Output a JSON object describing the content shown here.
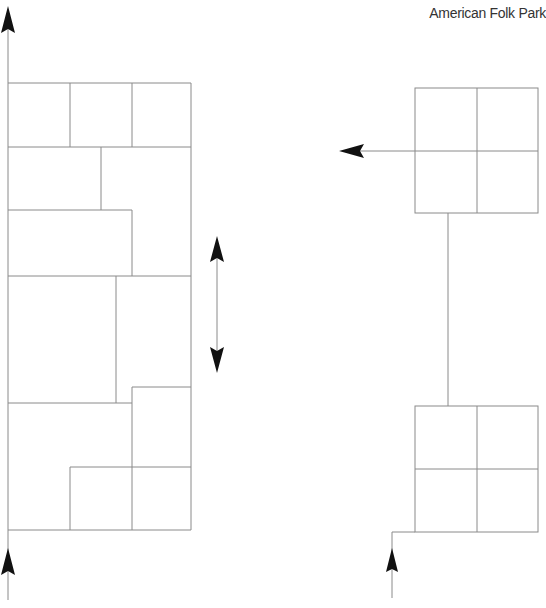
{
  "title": "American Folk Park",
  "colors": {
    "line": "#8a8a8a",
    "arrow": "#111111",
    "background": "#ffffff",
    "text": "#333333"
  },
  "diagram": {
    "left_block": {
      "description": "Stacked rectangular building layout with main path on left edge",
      "outline": {
        "x": 8,
        "y": 83,
        "w": 183,
        "h": 447
      }
    },
    "right_blocks": [
      {
        "name": "upper-2x2-block",
        "x": 415,
        "y": 88,
        "w": 123,
        "h": 125
      },
      {
        "name": "lower-2x2-block",
        "x": 415,
        "y": 406,
        "w": 123,
        "h": 126
      }
    ],
    "arrows": [
      {
        "name": "left-path-arrow-up-top",
        "direction": "up"
      },
      {
        "name": "left-path-arrow-up-bottom",
        "direction": "up"
      },
      {
        "name": "middle-double-arrow",
        "direction": "up-down"
      },
      {
        "name": "right-exit-arrow-left",
        "direction": "left"
      },
      {
        "name": "right-entry-arrow-up",
        "direction": "up"
      }
    ]
  }
}
